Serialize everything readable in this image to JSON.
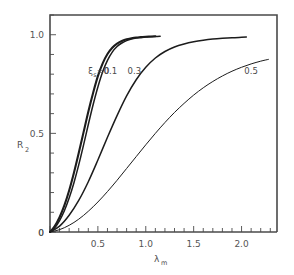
{
  "chart_data": {
    "type": "line",
    "title": "",
    "xlabel": "λ",
    "xlabel_sub": "m",
    "ylabel": "R",
    "ylabel_sub": "2",
    "xlim": [
      0.0,
      2.37
    ],
    "ylim": [
      0.0,
      1.1
    ],
    "grid": false,
    "legend": "inline-curve-labels",
    "xticks": [
      0.0,
      0.5,
      1.0,
      1.5,
      2.0
    ],
    "xtick_labels": [
      "0",
      "0.5",
      "1.0",
      "1.5",
      "2.0"
    ],
    "xminor_step": 0.1,
    "yticks": [
      0.0,
      0.5,
      1.0
    ],
    "ytick_labels": [
      "0",
      "0.5",
      "1.0"
    ],
    "yminor_step": 0.1,
    "series": [
      {
        "name": "ξ = 0",
        "label": "ξ",
        "label_sub": "s",
        "label_eq": "=0",
        "label_x": 0.4,
        "label_y": 0.8,
        "points": [
          [
            0.0,
            0.0
          ],
          [
            0.05,
            0.03
          ],
          [
            0.1,
            0.075
          ],
          [
            0.15,
            0.135
          ],
          [
            0.2,
            0.21
          ],
          [
            0.25,
            0.3
          ],
          [
            0.3,
            0.4
          ],
          [
            0.35,
            0.505
          ],
          [
            0.4,
            0.61
          ],
          [
            0.45,
            0.705
          ],
          [
            0.5,
            0.79
          ],
          [
            0.55,
            0.855
          ],
          [
            0.6,
            0.902
          ],
          [
            0.65,
            0.934
          ],
          [
            0.7,
            0.955
          ],
          [
            0.75,
            0.968
          ],
          [
            0.8,
            0.977
          ],
          [
            0.85,
            0.982
          ],
          [
            0.9,
            0.986
          ],
          [
            0.95,
            0.988
          ],
          [
            1.0,
            0.99
          ],
          [
            1.05,
            0.991
          ],
          [
            1.1,
            0.992
          ]
        ]
      },
      {
        "name": "0.1",
        "label": "0.1",
        "label_x": 0.63,
        "label_y": 0.8,
        "points": [
          [
            0.0,
            0.0
          ],
          [
            0.05,
            0.022
          ],
          [
            0.1,
            0.058
          ],
          [
            0.15,
            0.108
          ],
          [
            0.2,
            0.172
          ],
          [
            0.25,
            0.25
          ],
          [
            0.3,
            0.34
          ],
          [
            0.35,
            0.44
          ],
          [
            0.4,
            0.545
          ],
          [
            0.45,
            0.645
          ],
          [
            0.5,
            0.735
          ],
          [
            0.55,
            0.812
          ],
          [
            0.6,
            0.87
          ],
          [
            0.65,
            0.912
          ],
          [
            0.7,
            0.94
          ],
          [
            0.75,
            0.958
          ],
          [
            0.8,
            0.97
          ],
          [
            0.85,
            0.978
          ],
          [
            0.9,
            0.983
          ],
          [
            0.95,
            0.986
          ],
          [
            1.0,
            0.988
          ],
          [
            1.05,
            0.99
          ],
          [
            1.1,
            0.991
          ],
          [
            1.15,
            0.992
          ]
        ]
      },
      {
        "name": "0.3",
        "label": "0.3",
        "label_x": 0.88,
        "label_y": 0.8,
        "points": [
          [
            0.0,
            0.0
          ],
          [
            0.1,
            0.03
          ],
          [
            0.2,
            0.085
          ],
          [
            0.3,
            0.16
          ],
          [
            0.4,
            0.255
          ],
          [
            0.5,
            0.365
          ],
          [
            0.6,
            0.48
          ],
          [
            0.7,
            0.59
          ],
          [
            0.8,
            0.69
          ],
          [
            0.9,
            0.772
          ],
          [
            1.0,
            0.835
          ],
          [
            1.1,
            0.882
          ],
          [
            1.2,
            0.915
          ],
          [
            1.3,
            0.938
          ],
          [
            1.4,
            0.953
          ],
          [
            1.5,
            0.964
          ],
          [
            1.6,
            0.972
          ],
          [
            1.7,
            0.978
          ],
          [
            1.8,
            0.982
          ],
          [
            1.9,
            0.985
          ],
          [
            2.0,
            0.987
          ],
          [
            2.05,
            0.988
          ]
        ]
      },
      {
        "name": "0.5",
        "label": "0.5",
        "label_x": 2.1,
        "label_y": 0.8,
        "points": [
          [
            0.0,
            0.0
          ],
          [
            0.1,
            0.012
          ],
          [
            0.2,
            0.034
          ],
          [
            0.3,
            0.065
          ],
          [
            0.4,
            0.105
          ],
          [
            0.5,
            0.152
          ],
          [
            0.6,
            0.205
          ],
          [
            0.7,
            0.262
          ],
          [
            0.8,
            0.322
          ],
          [
            0.9,
            0.382
          ],
          [
            1.0,
            0.442
          ],
          [
            1.1,
            0.5
          ],
          [
            1.2,
            0.555
          ],
          [
            1.3,
            0.606
          ],
          [
            1.4,
            0.652
          ],
          [
            1.5,
            0.694
          ],
          [
            1.6,
            0.731
          ],
          [
            1.7,
            0.763
          ],
          [
            1.8,
            0.791
          ],
          [
            1.9,
            0.815
          ],
          [
            2.0,
            0.835
          ],
          [
            2.1,
            0.852
          ],
          [
            2.2,
            0.866
          ],
          [
            2.28,
            0.875
          ]
        ]
      }
    ]
  },
  "colors": {
    "curve": "#1c1c1c",
    "axis": "#4a4a4a",
    "text": "#4d4d4d",
    "background": "#ffffff"
  }
}
